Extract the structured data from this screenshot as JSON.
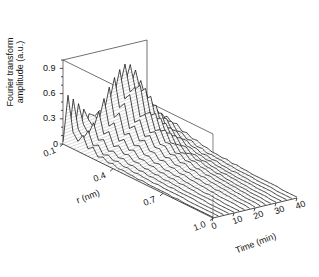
{
  "figure": {
    "type": "3d-waterfall-plot",
    "background": "#ffffff",
    "line_color": "#1a1a1a",
    "fill_color": "#d9d9d9"
  },
  "axes": {
    "z": {
      "title_line1": "Fourier transform",
      "title_line2": "amplitude (a.u.)",
      "ticks": [
        "0",
        "0.3",
        "0.6",
        "0.9"
      ],
      "values": [
        0,
        0.3,
        0.6,
        0.9
      ],
      "range": [
        0,
        1.0
      ]
    },
    "r": {
      "title": "r (nm)",
      "ticks": [
        "0.1",
        "0.4",
        "0.7",
        "1.0"
      ],
      "values": [
        0.1,
        0.4,
        0.7,
        1.0
      ],
      "range": [
        0.1,
        1.0
      ]
    },
    "time": {
      "title": "Time (min)",
      "ticks": [
        "0",
        "10",
        "20",
        "30",
        "40"
      ],
      "values": [
        0,
        10,
        20,
        30,
        40
      ],
      "range": [
        0,
        40
      ]
    }
  },
  "chart_data": {
    "type": "line",
    "title": "",
    "xlabel": "r (nm)",
    "ylabel": "Fourier transform amplitude (a.u.)",
    "zlabel": "Time (min)",
    "xlim": [
      0.1,
      1.0
    ],
    "ylim": [
      0,
      1.0
    ],
    "zlim": [
      0,
      40
    ],
    "grid": false,
    "legend": "none",
    "n_traces": 17,
    "trace_times": [
      0,
      2.5,
      5,
      7.5,
      10,
      12.5,
      15,
      17.5,
      20,
      22.5,
      25,
      27.5,
      30,
      32.5,
      35,
      37.5,
      40
    ],
    "x": [
      0.1,
      0.13,
      0.16,
      0.19,
      0.22,
      0.25,
      0.28,
      0.31,
      0.34,
      0.37,
      0.4,
      0.43,
      0.46,
      0.49,
      0.52,
      0.55,
      0.58,
      0.61,
      0.64,
      0.67,
      0.7,
      0.73,
      0.76,
      0.79,
      0.82,
      0.85,
      0.88,
      0.91,
      0.94,
      0.97,
      1.0
    ],
    "series": [
      {
        "name": "t=0 min",
        "values": [
          0.02,
          0.61,
          0.2,
          0.12,
          0.22,
          0.09,
          0.14,
          0.05,
          0.08,
          0.04,
          0.06,
          0.03,
          0.04,
          0.03,
          0.03,
          0.02,
          0.03,
          0.02,
          0.02,
          0.02,
          0.02,
          0.02,
          0.01,
          0.02,
          0.01,
          0.01,
          0.01,
          0.01,
          0.01,
          0.01,
          0.01
        ]
      },
      {
        "name": "t=2.5 min",
        "values": [
          0.02,
          0.55,
          0.22,
          0.14,
          0.26,
          0.11,
          0.15,
          0.06,
          0.09,
          0.05,
          0.07,
          0.04,
          0.05,
          0.03,
          0.04,
          0.03,
          0.03,
          0.02,
          0.03,
          0.02,
          0.02,
          0.02,
          0.02,
          0.02,
          0.01,
          0.01,
          0.01,
          0.01,
          0.01,
          0.01,
          0.01
        ]
      },
      {
        "name": "t=5 min",
        "values": [
          0.03,
          0.48,
          0.26,
          0.18,
          0.34,
          0.16,
          0.2,
          0.09,
          0.12,
          0.07,
          0.09,
          0.05,
          0.06,
          0.04,
          0.05,
          0.03,
          0.04,
          0.03,
          0.03,
          0.02,
          0.03,
          0.02,
          0.02,
          0.02,
          0.02,
          0.01,
          0.01,
          0.01,
          0.01,
          0.01,
          0.01
        ]
      },
      {
        "name": "t=7.5 min",
        "values": [
          0.03,
          0.4,
          0.3,
          0.24,
          0.46,
          0.22,
          0.28,
          0.13,
          0.17,
          0.1,
          0.12,
          0.07,
          0.08,
          0.05,
          0.06,
          0.04,
          0.05,
          0.03,
          0.04,
          0.03,
          0.03,
          0.02,
          0.02,
          0.02,
          0.02,
          0.02,
          0.01,
          0.01,
          0.01,
          0.01,
          0.01
        ]
      },
      {
        "name": "t=10 min",
        "values": [
          0.04,
          0.33,
          0.34,
          0.31,
          0.6,
          0.3,
          0.37,
          0.18,
          0.23,
          0.13,
          0.16,
          0.09,
          0.1,
          0.07,
          0.08,
          0.05,
          0.06,
          0.04,
          0.05,
          0.03,
          0.04,
          0.03,
          0.03,
          0.02,
          0.02,
          0.02,
          0.02,
          0.01,
          0.01,
          0.01,
          0.01
        ]
      },
      {
        "name": "t=12.5 min",
        "values": [
          0.05,
          0.28,
          0.38,
          0.4,
          0.72,
          0.39,
          0.47,
          0.24,
          0.29,
          0.17,
          0.2,
          0.12,
          0.13,
          0.08,
          0.1,
          0.06,
          0.07,
          0.05,
          0.06,
          0.04,
          0.04,
          0.03,
          0.03,
          0.02,
          0.03,
          0.02,
          0.02,
          0.01,
          0.01,
          0.01,
          0.01
        ]
      },
      {
        "name": "t=15 min",
        "values": [
          0.05,
          0.24,
          0.42,
          0.5,
          0.82,
          0.49,
          0.57,
          0.3,
          0.36,
          0.21,
          0.25,
          0.15,
          0.16,
          0.1,
          0.12,
          0.08,
          0.09,
          0.06,
          0.07,
          0.05,
          0.05,
          0.04,
          0.04,
          0.03,
          0.03,
          0.02,
          0.02,
          0.02,
          0.02,
          0.01,
          0.01
        ]
      },
      {
        "name": "t=17.5 min",
        "values": [
          0.06,
          0.21,
          0.45,
          0.59,
          0.9,
          0.58,
          0.66,
          0.36,
          0.42,
          0.25,
          0.29,
          0.18,
          0.19,
          0.12,
          0.14,
          0.09,
          0.1,
          0.07,
          0.08,
          0.05,
          0.06,
          0.04,
          0.05,
          0.03,
          0.04,
          0.03,
          0.03,
          0.02,
          0.02,
          0.02,
          0.01
        ]
      },
      {
        "name": "t=20 min",
        "values": [
          0.06,
          0.19,
          0.47,
          0.66,
          0.95,
          0.65,
          0.73,
          0.41,
          0.47,
          0.28,
          0.32,
          0.2,
          0.21,
          0.14,
          0.16,
          0.1,
          0.12,
          0.08,
          0.09,
          0.06,
          0.07,
          0.05,
          0.05,
          0.04,
          0.04,
          0.03,
          0.03,
          0.02,
          0.02,
          0.02,
          0.01
        ]
      },
      {
        "name": "t=22.5 min",
        "values": [
          0.06,
          0.17,
          0.45,
          0.68,
          0.93,
          0.67,
          0.74,
          0.43,
          0.48,
          0.29,
          0.33,
          0.21,
          0.22,
          0.14,
          0.16,
          0.11,
          0.12,
          0.08,
          0.09,
          0.06,
          0.07,
          0.05,
          0.05,
          0.04,
          0.04,
          0.03,
          0.03,
          0.02,
          0.02,
          0.02,
          0.01
        ]
      },
      {
        "name": "t=25 min",
        "values": [
          0.05,
          0.15,
          0.4,
          0.63,
          0.85,
          0.62,
          0.69,
          0.4,
          0.45,
          0.27,
          0.31,
          0.19,
          0.2,
          0.13,
          0.15,
          0.1,
          0.11,
          0.08,
          0.08,
          0.06,
          0.06,
          0.05,
          0.05,
          0.04,
          0.04,
          0.03,
          0.03,
          0.02,
          0.02,
          0.02,
          0.01
        ]
      },
      {
        "name": "t=27.5 min",
        "values": [
          0.05,
          0.13,
          0.33,
          0.53,
          0.71,
          0.52,
          0.58,
          0.34,
          0.38,
          0.23,
          0.26,
          0.16,
          0.17,
          0.11,
          0.13,
          0.09,
          0.1,
          0.07,
          0.07,
          0.05,
          0.06,
          0.04,
          0.04,
          0.03,
          0.03,
          0.03,
          0.02,
          0.02,
          0.02,
          0.01,
          0.01
        ]
      },
      {
        "name": "t=30 min",
        "values": [
          0.04,
          0.11,
          0.26,
          0.42,
          0.56,
          0.41,
          0.46,
          0.27,
          0.3,
          0.19,
          0.21,
          0.13,
          0.14,
          0.09,
          0.1,
          0.07,
          0.08,
          0.06,
          0.06,
          0.04,
          0.05,
          0.04,
          0.04,
          0.03,
          0.03,
          0.02,
          0.02,
          0.02,
          0.02,
          0.01,
          0.01
        ]
      },
      {
        "name": "t=32.5 min",
        "values": [
          0.04,
          0.09,
          0.2,
          0.32,
          0.43,
          0.32,
          0.35,
          0.21,
          0.23,
          0.15,
          0.17,
          0.11,
          0.11,
          0.08,
          0.08,
          0.06,
          0.07,
          0.05,
          0.05,
          0.04,
          0.04,
          0.03,
          0.03,
          0.03,
          0.03,
          0.02,
          0.02,
          0.02,
          0.01,
          0.01,
          0.01
        ]
      },
      {
        "name": "t=35 min",
        "values": [
          0.03,
          0.08,
          0.16,
          0.25,
          0.33,
          0.25,
          0.27,
          0.17,
          0.18,
          0.12,
          0.13,
          0.09,
          0.09,
          0.06,
          0.07,
          0.05,
          0.06,
          0.04,
          0.04,
          0.03,
          0.04,
          0.03,
          0.03,
          0.02,
          0.02,
          0.02,
          0.02,
          0.02,
          0.01,
          0.01,
          0.01
        ]
      },
      {
        "name": "t=37.5 min",
        "values": [
          0.03,
          0.07,
          0.13,
          0.2,
          0.26,
          0.2,
          0.22,
          0.14,
          0.15,
          0.1,
          0.11,
          0.07,
          0.08,
          0.05,
          0.06,
          0.05,
          0.05,
          0.04,
          0.04,
          0.03,
          0.03,
          0.03,
          0.03,
          0.02,
          0.02,
          0.02,
          0.02,
          0.01,
          0.01,
          0.01,
          0.01
        ]
      },
      {
        "name": "t=40 min",
        "values": [
          0.03,
          0.06,
          0.11,
          0.16,
          0.21,
          0.16,
          0.18,
          0.12,
          0.13,
          0.09,
          0.1,
          0.07,
          0.07,
          0.05,
          0.05,
          0.04,
          0.05,
          0.03,
          0.04,
          0.03,
          0.03,
          0.02,
          0.02,
          0.02,
          0.02,
          0.02,
          0.02,
          0.01,
          0.01,
          0.01,
          0.01
        ]
      }
    ]
  }
}
